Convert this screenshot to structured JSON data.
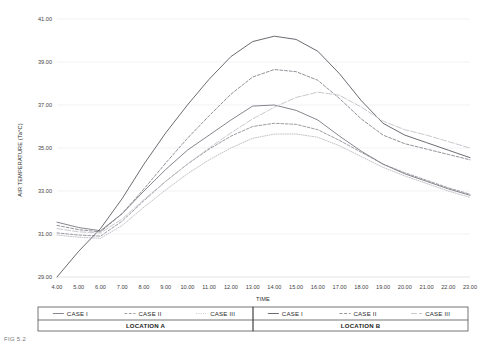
{
  "chart_data": {
    "type": "line",
    "title": "",
    "xlabel": "TIME",
    "ylabel": "AIR TEMPERATURE (Ta°C)",
    "xlim": [
      4,
      23
    ],
    "ylim": [
      29.0,
      41.0
    ],
    "ytick_step": 2.0,
    "grid": true,
    "legend_position": "bottom",
    "x": [
      4,
      5,
      6,
      7,
      8,
      9,
      10,
      11,
      12,
      13,
      14,
      15,
      16,
      17,
      18,
      19,
      20,
      21,
      22,
      23
    ],
    "xtick_labels": [
      "4.00",
      "5.00",
      "6.00",
      "7.00",
      "8.00",
      "9.00",
      "10.00",
      "11.00",
      "12.00",
      "13.00",
      "14.00",
      "15.00",
      "16.00",
      "17.00",
      "18.00",
      "19.00",
      "20.00",
      "21.00",
      "22.00",
      "23.00"
    ],
    "ytick_labels": [
      "29.00",
      "31.00",
      "33.00",
      "35.00",
      "37.00",
      "39.00",
      "41.00"
    ],
    "ytick_values": [
      29.0,
      31.0,
      33.0,
      35.0,
      37.0,
      39.0,
      41.0
    ],
    "series": [
      {
        "name": "CASE I",
        "group": "LOCATION A",
        "style": "solid",
        "color": "#6f6f78",
        "width": 0.85,
        "values": [
          31.55,
          31.3,
          31.15,
          31.95,
          33.0,
          34.0,
          34.9,
          35.6,
          36.3,
          36.95,
          37.0,
          36.75,
          36.3,
          35.55,
          34.85,
          34.25,
          33.8,
          33.45,
          33.1,
          32.8
        ]
      },
      {
        "name": "CASE II",
        "group": "LOCATION A",
        "style": "dashed",
        "color": "#8a8a92",
        "width": 0.85,
        "values": [
          31.05,
          30.95,
          30.9,
          31.6,
          32.55,
          33.45,
          34.25,
          34.95,
          35.55,
          36.0,
          36.15,
          36.1,
          35.85,
          35.35,
          34.8,
          34.25,
          33.85,
          33.5,
          33.15,
          32.85
        ]
      },
      {
        "name": "CASE III",
        "group": "LOCATION A",
        "style": "dotted",
        "color": "#b8b8be",
        "width": 0.85,
        "values": [
          30.95,
          30.85,
          30.8,
          31.4,
          32.25,
          33.05,
          33.8,
          34.45,
          35.0,
          35.45,
          35.65,
          35.65,
          35.5,
          35.1,
          34.6,
          34.1,
          33.7,
          33.35,
          33.0,
          32.7
        ]
      },
      {
        "name": "CASE I",
        "group": "LOCATION B",
        "style": "solid",
        "color": "#5a5a62",
        "width": 0.9,
        "values": [
          29.0,
          30.2,
          31.25,
          32.65,
          34.25,
          35.7,
          37.0,
          38.2,
          39.25,
          39.95,
          40.2,
          40.05,
          39.5,
          38.45,
          37.2,
          36.15,
          35.6,
          35.25,
          34.9,
          34.55
        ]
      },
      {
        "name": "CASE II",
        "group": "LOCATION B",
        "style": "dashed",
        "color": "#86868e",
        "width": 0.9,
        "values": [
          31.4,
          31.2,
          31.1,
          31.95,
          33.1,
          34.3,
          35.45,
          36.5,
          37.5,
          38.3,
          38.65,
          38.55,
          38.15,
          37.3,
          36.35,
          35.6,
          35.2,
          34.95,
          34.7,
          34.45
        ]
      },
      {
        "name": "CASE III",
        "group": "LOCATION B",
        "style": "longdash",
        "color": "#c3c3c9",
        "width": 0.9,
        "values": [
          31.25,
          31.1,
          31.05,
          31.7,
          32.6,
          33.45,
          34.25,
          35.0,
          35.7,
          36.35,
          36.9,
          37.35,
          37.6,
          37.45,
          36.9,
          36.25,
          35.85,
          35.6,
          35.3,
          35.0
        ]
      }
    ]
  },
  "legend": {
    "groups": [
      {
        "group_label": "LOCATION A",
        "entries": [
          {
            "label": "CASE I",
            "style": "solid"
          },
          {
            "label": "CASE II",
            "style": "dashed"
          },
          {
            "label": "CASE III",
            "style": "dotted"
          }
        ]
      },
      {
        "group_label": "LOCATION B",
        "entries": [
          {
            "label": "CASE I",
            "style": "solid"
          },
          {
            "label": "CASE II",
            "style": "dashed"
          },
          {
            "label": "CASE III",
            "style": "longdash"
          }
        ]
      }
    ]
  },
  "caption": {
    "text": "FIG 5.2"
  }
}
